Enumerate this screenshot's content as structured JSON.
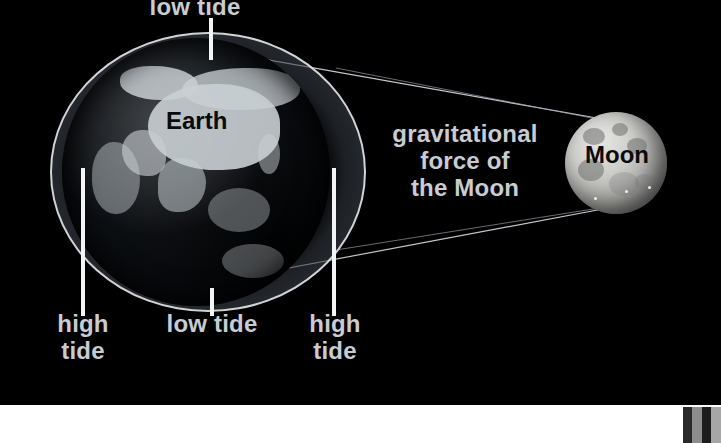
{
  "diagram": {
    "background_color": "#000000",
    "label_color": "#c9ccd0",
    "dark_label_color": "#0b0b0b",
    "bottom_strip_color": "#ffffff"
  },
  "bodies": {
    "earth": {
      "label": "Earth",
      "label_color": "#0b0b0b"
    },
    "moon": {
      "label": "Moon",
      "label_color": "#0b0b0b"
    }
  },
  "annotations": {
    "low_tide_top": "low tide",
    "high_tide_left": "high\ntide",
    "low_tide_bottom": "low tide",
    "high_tide_right": "high\ntide",
    "gravitational_force": "gravitational\nforce of\nthe Moon"
  },
  "swatches": [
    {
      "color": "#2a2a2a",
      "width": 9
    },
    {
      "color": "#8d8d8d",
      "width": 10
    },
    {
      "color": "#1d1d1d",
      "width": 9
    },
    {
      "color": "#a6a6a6",
      "width": 10
    }
  ]
}
